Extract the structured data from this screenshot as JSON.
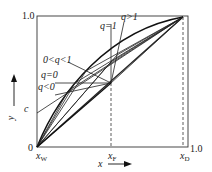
{
  "figure": {
    "type": "McCabe-Thiele diagram with q-lines",
    "axis": {
      "x_label": "x",
      "y_label": "y",
      "origin_label": "0",
      "x_max_label": "1.0",
      "y_max_label": "1.0",
      "x_ticks": [
        {
          "label": "x",
          "sub": "W"
        },
        {
          "label": "x",
          "sub": "F"
        },
        {
          "label": "x",
          "sub": "D"
        }
      ],
      "intercept_label": "c"
    },
    "q_lines": [
      {
        "label": "q>1"
      },
      {
        "label": "q=1"
      },
      {
        "label": "0<q<1"
      },
      {
        "label": "q=0"
      },
      {
        "label": "q<0"
      }
    ],
    "colors": {
      "line": "#222222",
      "background": "#ffffff"
    }
  }
}
